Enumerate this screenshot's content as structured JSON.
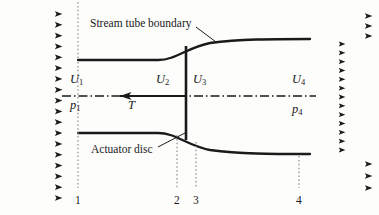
{
  "figure": {
    "type": "schematic-diagram",
    "width": 379,
    "height": 215,
    "line_color": "#1a1a1a",
    "background": "#fdfdfc"
  },
  "callouts": {
    "stream_tube": "Stream tube boundary",
    "actuator_disc": "Actuator disc"
  },
  "velocity_labels": [
    {
      "name": "U1",
      "base": "U",
      "sub": "1",
      "x": 70,
      "y": 72
    },
    {
      "name": "U2",
      "base": "U",
      "sub": "2",
      "x": 156,
      "y": 72
    },
    {
      "name": "U3",
      "base": "U",
      "sub": "3",
      "x": 193,
      "y": 72
    },
    {
      "name": "U4",
      "base": "U",
      "sub": "4",
      "x": 292,
      "y": 72
    }
  ],
  "pressure_labels": [
    {
      "name": "p1",
      "base": "p",
      "sub": "1",
      "x": 70,
      "y": 98
    },
    {
      "name": "p4",
      "base": "p",
      "sub": "4",
      "x": 292,
      "y": 102
    }
  ],
  "thrust_label": {
    "name": "T",
    "base": "T",
    "sub": "",
    "x": 128,
    "y": 98
  },
  "stations": [
    {
      "label": "1",
      "x": 78,
      "y": 194
    },
    {
      "label": "2",
      "x": 177,
      "y": 194
    },
    {
      "label": "3",
      "x": 196,
      "y": 194
    },
    {
      "label": "4",
      "x": 299,
      "y": 194
    }
  ],
  "geometry": {
    "centerline_y": 96,
    "disc_x": 186,
    "disc_top_y": 46,
    "disc_bottom_y": 140,
    "upper_boundary": "M78,60 L158,60 C176,60 186,48 210,43 C240,39 270,39 310,39",
    "lower_boundary": "M78,133 L158,133 C176,133 186,145 210,150 C240,154 270,154 310,154",
    "inlet_arrows": {
      "count": 18,
      "x_start": 8,
      "x_end": 62,
      "y_top": 14,
      "y_bottom": 198
    },
    "outlet_far_arrows": {
      "count": 6,
      "x_start": 318,
      "x_end": 372
    },
    "outlet_wake_arrows": {
      "count": 13,
      "x_start": 318,
      "x_end": 345,
      "y_top": 44,
      "y_bottom": 150
    }
  }
}
